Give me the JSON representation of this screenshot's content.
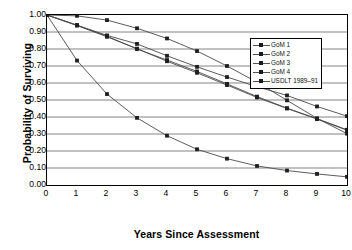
{
  "chart_data": {
    "type": "line",
    "title": "",
    "xlabel": "Years Since Assessment",
    "ylabel": "Probability of Surviving",
    "xlim": [
      0,
      10
    ],
    "ylim": [
      0.0,
      1.0
    ],
    "grid": "horizontal",
    "legend_position": "upper-right-inside",
    "x": [
      0,
      1,
      2,
      3,
      4,
      5,
      6,
      7,
      8,
      9,
      10
    ],
    "xticks": [
      "0",
      "1",
      "2",
      "3",
      "4",
      "5",
      "6",
      "7",
      "8",
      "9",
      "10"
    ],
    "yticks": [
      "1.00",
      "0.90",
      "0.80",
      "0.70",
      "0.60",
      "0.50",
      "0.40",
      "0.30",
      "0.20",
      "0.10",
      "0.00"
    ],
    "marker": "square",
    "series": [
      {
        "name": "GoM 1",
        "values": [
          1.0,
          0.94,
          0.88,
          0.83,
          0.76,
          0.695,
          0.635,
          0.578,
          0.527,
          0.462,
          0.405
        ]
      },
      {
        "name": "GoM 2",
        "values": [
          1.0,
          0.94,
          0.875,
          0.8,
          0.735,
          0.668,
          0.595,
          0.52,
          0.452,
          0.39,
          0.325
        ]
      },
      {
        "name": "GoM 3",
        "values": [
          1.0,
          0.938,
          0.872,
          0.802,
          0.728,
          0.66,
          0.588,
          0.515,
          0.45,
          0.388,
          0.322
        ]
      },
      {
        "name": "GoM 4",
        "values": [
          1.0,
          0.732,
          0.535,
          0.395,
          0.29,
          0.21,
          0.155,
          0.112,
          0.085,
          0.065,
          0.048
        ]
      },
      {
        "name": "USDLT 1989–91",
        "values": [
          1.0,
          0.995,
          0.97,
          0.922,
          0.862,
          0.788,
          0.7,
          0.605,
          0.498,
          0.392,
          0.302
        ]
      }
    ]
  },
  "legend": {
    "items": [
      {
        "label": "GoM 1"
      },
      {
        "label": "GoM 2"
      },
      {
        "label": "GoM 3"
      },
      {
        "label": "GoM 4"
      },
      {
        "label": "USDLT 1989–91"
      }
    ]
  }
}
